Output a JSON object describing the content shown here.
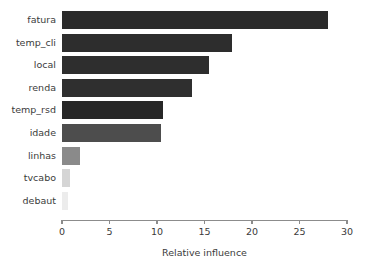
{
  "chart_data": {
    "type": "bar",
    "orientation": "horizontal",
    "title": "",
    "subtitle": "",
    "xlabel": "Relative influence",
    "ylabel": "",
    "categories": [
      "fatura",
      "temp_cli",
      "local",
      "renda",
      "temp_rsd",
      "idade",
      "linhas",
      "tvcabo",
      "debaut"
    ],
    "values": [
      28.0,
      17.9,
      15.5,
      13.7,
      10.6,
      10.4,
      1.9,
      0.85,
      0.6
    ],
    "bar_colors": [
      "#2b2b2b",
      "#2d2d2d",
      "#2e2e2e",
      "#2f2f2f",
      "#272727",
      "#4d4d4d",
      "#8a8a8a",
      "#d5d5d5",
      "#ececec"
    ],
    "xlim": [
      0,
      30
    ],
    "xticks": [
      0,
      5,
      10,
      15,
      20,
      25,
      30
    ],
    "xtick_labels": [
      "0",
      "5",
      "10",
      "15",
      "20",
      "25",
      "30"
    ],
    "grid": false,
    "legend": null,
    "legend_position": "none",
    "axis_color": "#8c8c8c",
    "text_color": "#3b3b3b",
    "background": "#ffffff"
  }
}
